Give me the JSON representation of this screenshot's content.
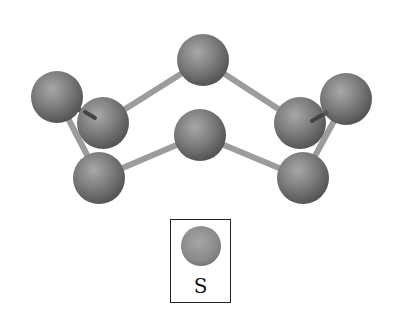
{
  "diagram": {
    "title": "",
    "molecule": "S8 crown ring",
    "atom_color": "#7a7a7a",
    "bond_color": "#9a9a9a",
    "atoms": [
      {
        "id": "top",
        "x": 203,
        "y": 60
      },
      {
        "id": "left-back",
        "x": 57,
        "y": 97
      },
      {
        "id": "left-front",
        "x": 103,
        "y": 123
      },
      {
        "id": "center",
        "x": 200,
        "y": 135
      },
      {
        "id": "right-front",
        "x": 300,
        "y": 123
      },
      {
        "id": "right-back",
        "x": 346,
        "y": 99
      },
      {
        "id": "bottom-left",
        "x": 99,
        "y": 178
      },
      {
        "id": "bottom-right",
        "x": 303,
        "y": 178
      }
    ],
    "bonds": [
      [
        "left-front",
        "top"
      ],
      [
        "top",
        "right-front"
      ],
      [
        "right-front",
        "right-back"
      ],
      [
        "right-back",
        "bottom-right"
      ],
      [
        "bottom-right",
        "center"
      ],
      [
        "center",
        "bottom-left"
      ],
      [
        "bottom-left",
        "left-back"
      ],
      [
        "left-back",
        "left-front"
      ]
    ]
  },
  "legend": {
    "items": [
      {
        "symbol": "S",
        "color": "#8a8a8a"
      }
    ]
  }
}
